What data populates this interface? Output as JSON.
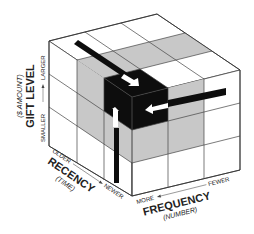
{
  "diagram": {
    "type": "rfm-cube",
    "axes": {
      "vertical": {
        "title": "GIFT LEVEL",
        "subtitle": "($ AMOUNT)",
        "low": "SMALLER",
        "high": "LARGER"
      },
      "left": {
        "title": "RECENCY",
        "subtitle": "(TIME)",
        "low": "OLDER",
        "high": "NEWER"
      },
      "right": {
        "title": "FREQUENCY",
        "subtitle": "(NUMBER)",
        "low": "MORE",
        "high": "FEWER"
      }
    },
    "grid": "3x3x3",
    "colors": {
      "line": "#444444",
      "face": "#ffffff",
      "highlight_gray": "#c8c8c8",
      "core_black": "#0d0d0d",
      "arrow_white": "#ffffff"
    }
  }
}
